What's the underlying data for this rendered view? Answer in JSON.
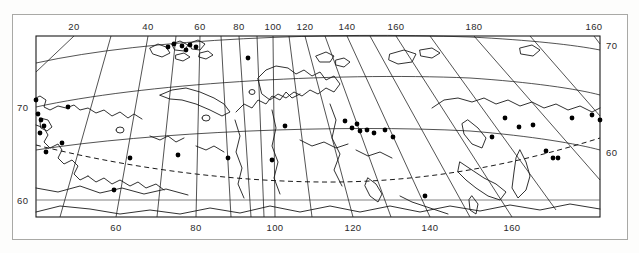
{
  "figure": {
    "kind": "map",
    "region": "Northern Eurasia / Russia",
    "projection": "conic",
    "background_color": "#ffffff",
    "line_color": "#1a1a1a",
    "frame_color": "#a9a9a6",
    "marker_color": "#000000"
  },
  "axes": {
    "longitude_top": [
      {
        "label": "20",
        "x": 74
      },
      {
        "label": "40",
        "x": 148
      },
      {
        "label": "60",
        "x": 200
      },
      {
        "label": "80",
        "x": 239
      },
      {
        "label": "100",
        "x": 273
      },
      {
        "label": "120",
        "x": 305
      },
      {
        "label": "140",
        "x": 347
      },
      {
        "label": "160",
        "x": 396
      },
      {
        "label": "180",
        "x": 474
      },
      {
        "label": "160",
        "x": 594
      }
    ],
    "longitude_bottom": [
      {
        "label": "60",
        "x": 116
      },
      {
        "label": "80",
        "x": 196
      },
      {
        "label": "100",
        "x": 275
      },
      {
        "label": "120",
        "x": 353
      },
      {
        "label": "140",
        "x": 430
      },
      {
        "label": "160",
        "x": 512
      }
    ],
    "latitude_left": [
      {
        "label": "70",
        "y": 107
      },
      {
        "label": "60",
        "y": 200
      }
    ],
    "latitude_right": [
      {
        "label": "70",
        "y": 45
      },
      {
        "label": "60",
        "y": 152
      }
    ]
  },
  "legend_lines": {
    "graticule": "solid thin black lines",
    "coastline": "solid black outline",
    "boundary_dashed": "dashed black curve across southern half"
  },
  "chart_data": {
    "type": "scatter",
    "title": "",
    "xlabel": "",
    "ylabel": "",
    "xlim": [
      10,
      200
    ],
    "ylim": [
      55,
      80
    ],
    "grid": true,
    "legend": "none",
    "point_count": 40,
    "points_px": [
      [
        38,
        114
      ],
      [
        41,
        120
      ],
      [
        44,
        126
      ],
      [
        40,
        133
      ],
      [
        62,
        143
      ],
      [
        68,
        107
      ],
      [
        36,
        100
      ],
      [
        46,
        152
      ],
      [
        114,
        190
      ],
      [
        130,
        158
      ],
      [
        178,
        155
      ],
      [
        228,
        158
      ],
      [
        272,
        160
      ],
      [
        285,
        126
      ],
      [
        345,
        121
      ],
      [
        352,
        128
      ],
      [
        357,
        124
      ],
      [
        360,
        131
      ],
      [
        367,
        130
      ],
      [
        374,
        133
      ],
      [
        385,
        130
      ],
      [
        393,
        137
      ],
      [
        425,
        196
      ],
      [
        519,
        127
      ],
      [
        533,
        125
      ],
      [
        546,
        151
      ],
      [
        553,
        158
      ],
      [
        558,
        158
      ],
      [
        572,
        118
      ],
      [
        592,
        115
      ],
      [
        600,
        120
      ],
      [
        505,
        118
      ],
      [
        492,
        137
      ],
      [
        248,
        58
      ],
      [
        168,
        47
      ],
      [
        182,
        46
      ],
      [
        174,
        44
      ],
      [
        186,
        50
      ],
      [
        190,
        45
      ],
      [
        196,
        47
      ]
    ]
  }
}
